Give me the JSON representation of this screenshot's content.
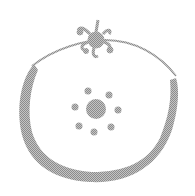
{
  "image": {
    "subject": "sketched round fruit with leafy stem and seed pattern",
    "icon": "fruit-icon",
    "colors": {
      "background": "#ffffff",
      "stroke": "#a6a6a6",
      "fill": "#9e9e9e"
    },
    "seeds": [
      {
        "cx": 88,
        "cy": 91,
        "r": 3.5
      },
      {
        "cx": 109,
        "cy": 95,
        "r": 3.5
      },
      {
        "cx": 75,
        "cy": 107,
        "r": 3.5
      },
      {
        "cx": 118,
        "cy": 110,
        "r": 3.5
      },
      {
        "cx": 79,
        "cy": 126,
        "r": 3.5
      },
      {
        "cx": 94,
        "cy": 132,
        "r": 3.5
      },
      {
        "cx": 111,
        "cy": 127,
        "r": 3.5
      }
    ],
    "center_seed": {
      "cx": 96,
      "cy": 109,
      "r": 10
    }
  }
}
